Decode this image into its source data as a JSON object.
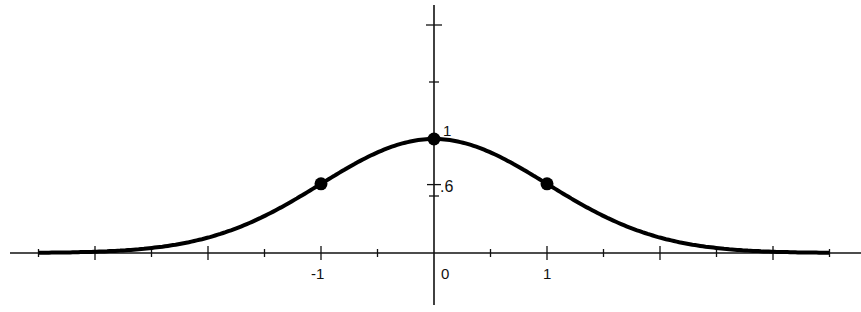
{
  "chart_data": {
    "type": "line",
    "title": "",
    "subtitle": "",
    "xlabel": "",
    "ylabel": "",
    "function": "y = e^(-x^2/2)",
    "x_tick_labels": [
      "-1",
      "0",
      "1"
    ],
    "y_tick_labels": [
      "1",
      ".6"
    ],
    "xlim": [
      -3.5,
      3.6
    ],
    "ylim": [
      0,
      2.1
    ],
    "grid": false,
    "legend": null,
    "series": [
      {
        "name": "bell curve",
        "x": [
          -3.5,
          -3,
          -2.5,
          -2,
          -1.5,
          -1,
          -0.5,
          0,
          0.5,
          1,
          1.5,
          2,
          2.5,
          3,
          3.5
        ],
        "y": [
          0.002,
          0.011,
          0.044,
          0.135,
          0.325,
          0.607,
          0.882,
          1.0,
          0.882,
          0.607,
          0.325,
          0.135,
          0.044,
          0.011,
          0.002
        ]
      }
    ],
    "marked_points": [
      {
        "x": -1,
        "y": 0.6
      },
      {
        "x": 0,
        "y": 1
      },
      {
        "x": 1,
        "y": 0.6
      }
    ],
    "annotations": [
      "1",
      ".6"
    ]
  },
  "labels": {
    "x_neg1": "-1",
    "x_0": "0",
    "x_1": "1",
    "y_1": "1",
    "y_06": ".6"
  }
}
